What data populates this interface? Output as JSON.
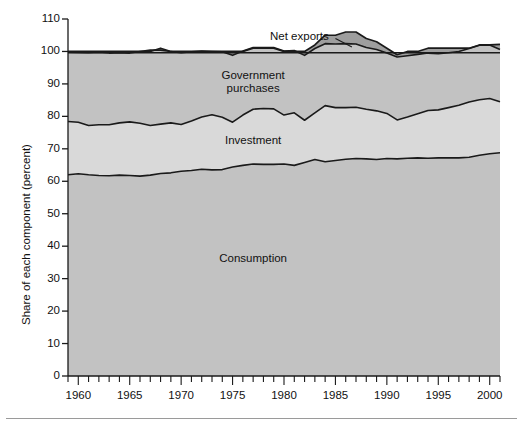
{
  "chart_data": {
    "type": "area",
    "title": "",
    "subtitle": "",
    "xlabel": "",
    "ylabel": "Share of each component (percent)",
    "xlim": [
      1959,
      2001
    ],
    "ylim": [
      0,
      110
    ],
    "grid": false,
    "legend_position": "inline-annotations",
    "stacked": true,
    "yticks": [
      0,
      10,
      20,
      30,
      40,
      50,
      60,
      70,
      80,
      90,
      100,
      110
    ],
    "ytick_labels": [
      "0",
      "10",
      "20",
      "30",
      "40",
      "50",
      "60",
      "70",
      "80",
      "90",
      "100",
      "110"
    ],
    "xticks": [
      1960,
      1965,
      1970,
      1975,
      1980,
      1985,
      1990,
      1995,
      2000
    ],
    "xtick_labels": [
      "1960",
      "1965",
      "1970",
      "1975",
      "1980",
      "1985",
      "1990",
      "1995",
      "2000"
    ],
    "x_minor_tick_interval": 1,
    "x": [
      1959,
      1960,
      1961,
      1962,
      1963,
      1964,
      1965,
      1966,
      1967,
      1968,
      1969,
      1970,
      1971,
      1972,
      1973,
      1974,
      1975,
      1976,
      1977,
      1978,
      1979,
      1980,
      1981,
      1982,
      1983,
      1984,
      1985,
      1986,
      1987,
      1988,
      1989,
      1990,
      1991,
      1992,
      1993,
      1994,
      1995,
      1996,
      1997,
      1998,
      1999,
      2000,
      2001
    ],
    "series": [
      {
        "name": "Consumption",
        "color": "#c2c2c2",
        "values": [
          62.0,
          62.3,
          62.0,
          61.8,
          61.7,
          61.9,
          61.8,
          61.6,
          61.9,
          62.4,
          62.6,
          63.1,
          63.3,
          63.7,
          63.5,
          63.6,
          64.4,
          64.9,
          65.3,
          65.2,
          65.2,
          65.3,
          64.9,
          65.8,
          66.7,
          66.0,
          66.4,
          66.8,
          67.0,
          66.9,
          66.7,
          67.0,
          66.9,
          67.1,
          67.2,
          67.1,
          67.2,
          67.2,
          67.2,
          67.4,
          68.0,
          68.5,
          68.8
        ]
      },
      {
        "name": "Investment",
        "color": "#d9d9d9",
        "values": [
          16.4,
          15.9,
          15.2,
          15.6,
          15.7,
          16.1,
          16.5,
          16.3,
          15.3,
          15.2,
          15.4,
          14.4,
          15.3,
          16.1,
          17.0,
          16.1,
          13.8,
          15.5,
          16.9,
          17.2,
          17.1,
          15.1,
          16.2,
          13.0,
          14.4,
          17.3,
          16.3,
          15.9,
          15.8,
          15.3,
          15.0,
          13.9,
          12.0,
          12.7,
          13.6,
          14.7,
          14.8,
          15.5,
          16.2,
          17.0,
          17.1,
          17.0,
          15.7
        ]
      },
      {
        "name": "Government purchases",
        "color": "#c2c2c2",
        "values": [
          21.4,
          21.5,
          22.4,
          22.4,
          22.1,
          21.6,
          21.2,
          22.1,
          23.2,
          22.8,
          22.0,
          22.1,
          21.3,
          20.3,
          19.5,
          20.2,
          20.6,
          19.7,
          19.0,
          18.8,
          18.9,
          19.7,
          19.2,
          20.0,
          19.8,
          19.1,
          19.6,
          19.7,
          19.5,
          19.0,
          18.9,
          18.6,
          19.4,
          18.9,
          18.3,
          17.7,
          17.3,
          16.9,
          16.6,
          16.5,
          16.8,
          16.5,
          16.1
        ]
      },
      {
        "name": "Net exports",
        "color": "#9e9e9e",
        "values": [
          0.2,
          0.3,
          0.4,
          0.2,
          0.5,
          0.4,
          0.5,
          0.0,
          -0.4,
          0.6,
          0.0,
          0.4,
          0.1,
          -0.1,
          0.0,
          0.1,
          1.2,
          -0.1,
          -0.2,
          -0.2,
          -0.2,
          -0.1,
          -0.3,
          1.2,
          1.1,
          2.6,
          2.7,
          3.6,
          3.7,
          2.8,
          2.4,
          1.5,
          0.7,
          1.3,
          0.9,
          1.5,
          1.7,
          1.4,
          1.0,
          0.1,
          0.1,
          0.0,
          1.6
        ]
      }
    ],
    "annotations": [
      {
        "text": "Net exports",
        "x": 1981.5,
        "y": 104.5,
        "leader": true
      },
      {
        "text": "Government purchases",
        "x": 1977,
        "y": 90.5,
        "leader": false
      },
      {
        "text": "Investment",
        "x": 1977,
        "y": 72.5,
        "leader": false
      },
      {
        "text": "Consumption",
        "x": 1977,
        "y": 36.0,
        "leader": false
      }
    ]
  }
}
